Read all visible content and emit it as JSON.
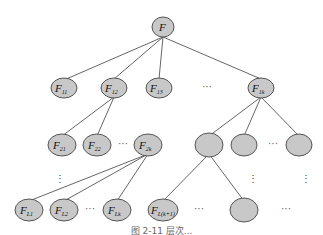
{
  "diagram": {
    "type": "tree",
    "colors": {
      "node_fill": "#c8c8c8",
      "node_stroke": "#555555",
      "edge": "#555555"
    },
    "root": {
      "label": "F",
      "sub": ""
    },
    "level1": [
      {
        "label": "F",
        "sub": "11"
      },
      {
        "label": "F",
        "sub": "12"
      },
      {
        "label": "F",
        "sub": "13"
      },
      {
        "label": "F",
        "sub": "1k"
      }
    ],
    "level2_left": [
      {
        "label": "F",
        "sub": "21"
      },
      {
        "label": "F",
        "sub": "22"
      },
      {
        "label": "F",
        "sub": "2k"
      }
    ],
    "level2_right_blank_count": 3,
    "leaves": [
      {
        "label": "F",
        "sub": "L1"
      },
      {
        "label": "F",
        "sub": "L2"
      },
      {
        "label": "F",
        "sub": "Lk"
      },
      {
        "label": "F",
        "sub": "L(k+1)"
      }
    ],
    "ellipsis_h": "···",
    "ellipsis_v": "⋮"
  },
  "caption": "图 2-11  层次..."
}
